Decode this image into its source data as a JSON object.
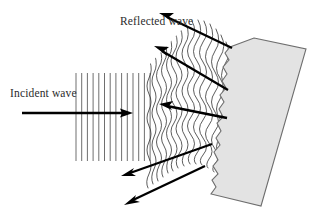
{
  "figure": {
    "background_color": "#ffffff",
    "width": 321,
    "height": 218
  },
  "labels": {
    "incident": "Incident wave",
    "reflected": "Reflected wave"
  },
  "colors": {
    "ink": "#000000",
    "text": "#2b2b2b",
    "grid_line": "#555555",
    "wave_line": "#333333",
    "block_fill": "#e3e3e3",
    "block_stroke": "#6e6e6e"
  },
  "incident_wave": {
    "description": "straight vertical parallel wavefronts travelling to the right",
    "wavefront_count": 14,
    "x_start": 76,
    "x_end": 150,
    "spacing": 5.7,
    "y_top": 73,
    "y_bottom": 161,
    "ray": {
      "x1": 22,
      "y1": 113,
      "x2": 133,
      "y2": 113,
      "direction": "right",
      "arrow_count": 1
    }
  },
  "reflected_wave": {
    "description": "distorted wavy wavefronts spreading away from the rough surface",
    "wavefront_count": 20,
    "rays": [
      {
        "id": "upper-1",
        "x1": 232,
        "y1": 48,
        "x2": 160,
        "y2": 14,
        "direction": "up-left"
      },
      {
        "id": "upper-2",
        "x1": 228,
        "y1": 90,
        "x2": 155,
        "y2": 47,
        "direction": "up-left"
      },
      {
        "id": "middle",
        "x1": 227,
        "y1": 118,
        "x2": 160,
        "y2": 105,
        "direction": "left"
      },
      {
        "id": "lower-1",
        "x1": 212,
        "y1": 144,
        "x2": 122,
        "y2": 175,
        "direction": "down-left"
      },
      {
        "id": "lower-2",
        "x1": 205,
        "y1": 166,
        "x2": 125,
        "y2": 204,
        "direction": "down-left"
      }
    ]
  },
  "reflecting_block": {
    "description": "tilted rectangular slab with a rough jagged reflecting face",
    "fill": "#e3e3e3",
    "corners": [
      {
        "x": 254,
        "y": 38
      },
      {
        "x": 306,
        "y": 49
      },
      {
        "x": 261,
        "y": 206
      },
      {
        "x": 211,
        "y": 194
      }
    ],
    "rough_face": "left",
    "tilt": "top edge leans right, surface slopes down-left"
  }
}
